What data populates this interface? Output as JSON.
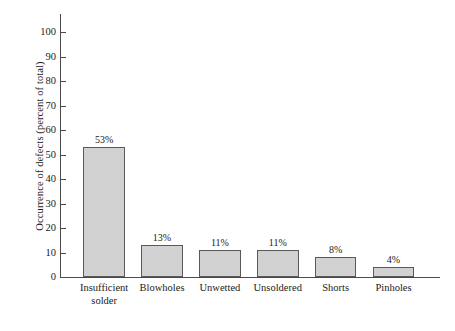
{
  "chart_data": {
    "type": "bar",
    "title": "",
    "subtitle": "",
    "xlabel": "",
    "ylabel": "Occurrence of defects (percent of total)",
    "categories": [
      "Insufficient\nsolder",
      "Blowholes",
      "Unwetted",
      "Unsoldered",
      "Shorts",
      "Pinholes"
    ],
    "values": [
      53,
      13,
      11,
      11,
      8,
      4
    ],
    "value_labels": [
      "53%",
      "13%",
      "11%",
      "11%",
      "8%",
      "4%"
    ],
    "ylim": [
      0,
      100
    ],
    "ytick_labels": [
      "100",
      "90",
      "80",
      "70",
      "60",
      "50",
      "40",
      "30",
      "20",
      "10",
      "0"
    ],
    "ytick_values": [
      100,
      90,
      80,
      70,
      60,
      50,
      40,
      30,
      20,
      10,
      0
    ],
    "grid": false,
    "legend": false,
    "legend_position": "none",
    "bar_fill_color": "#d2d2d2",
    "bar_border_color": "#595959",
    "axis_color": "#4a4a4a",
    "background_color": "#ffffff"
  }
}
